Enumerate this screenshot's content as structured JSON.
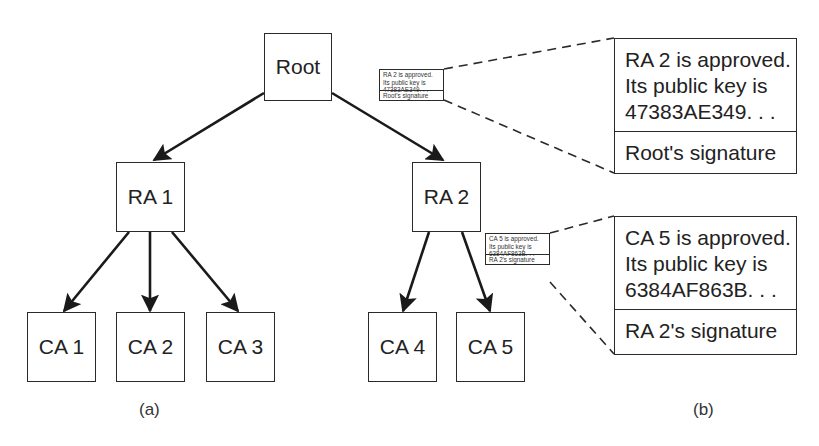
{
  "figure": {
    "part_a": {
      "caption": "(a)",
      "nodes": {
        "root": "Root",
        "ra1": "RA 1",
        "ra2": "RA 2",
        "ca1": "CA 1",
        "ca2": "CA 2",
        "ca3": "CA 3",
        "ca4": "CA 4",
        "ca5": "CA 5"
      },
      "edges": [
        {
          "from": "Root",
          "to": "RA 1"
        },
        {
          "from": "Root",
          "to": "RA 2"
        },
        {
          "from": "RA 1",
          "to": "CA 1"
        },
        {
          "from": "RA 1",
          "to": "CA 2"
        },
        {
          "from": "RA 1",
          "to": "CA 3"
        },
        {
          "from": "RA 2",
          "to": "CA 4"
        },
        {
          "from": "RA 2",
          "to": "CA 5"
        }
      ]
    },
    "part_b": {
      "caption": "(b)",
      "certificates": [
        {
          "lines": [
            "RA 2 is approved.",
            "Its public key is",
            "47383AE349. . ."
          ],
          "signature": "Root's signature"
        },
        {
          "lines": [
            "CA 5 is approved.",
            "Its public key is",
            "6384AF863B. . ."
          ],
          "signature": "RA 2's signature"
        }
      ]
    },
    "colors": {
      "stroke": "#2a2a2a",
      "background": "#ffffff",
      "text": "#222222"
    }
  }
}
